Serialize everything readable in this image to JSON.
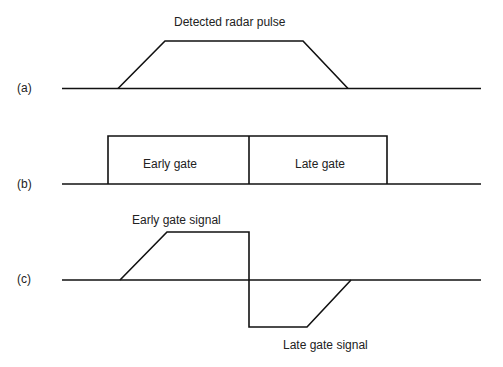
{
  "diagram": {
    "colors": {
      "line": "#111111",
      "text": "#222222",
      "background": "#ffffff"
    },
    "panels": [
      {
        "id": "a",
        "label": "(a)",
        "caption": "Detected radar pulse",
        "baseline_y": 88.5,
        "baseline_x": [
          62,
          481
        ],
        "waveform": [
          [
            118,
            88.5
          ],
          [
            165,
            41
          ],
          [
            303,
            41
          ],
          [
            348,
            88.5
          ]
        ]
      },
      {
        "id": "b",
        "label": "(b)",
        "baseline_y": 184,
        "baseline_x": [
          62,
          481
        ],
        "gates": [
          {
            "name": "Early gate",
            "x0": 108,
            "x1": 249,
            "top": 136
          },
          {
            "name": "Late gate",
            "x0": 249,
            "x1": 387,
            "top": 136
          }
        ]
      },
      {
        "id": "c",
        "label": "(c)",
        "baseline_y": 280,
        "baseline_x": [
          62,
          481
        ],
        "early_signal_label": "Early gate signal",
        "late_signal_label": "Late gate signal",
        "waveform": [
          [
            120,
            280
          ],
          [
            167,
            232
          ],
          [
            249,
            232
          ],
          [
            249,
            327
          ],
          [
            307,
            327
          ],
          [
            351,
            280
          ]
        ]
      }
    ]
  }
}
